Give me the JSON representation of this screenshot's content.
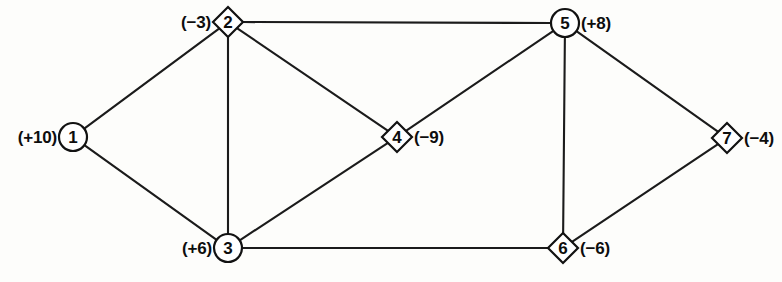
{
  "diagram": {
    "type": "network-flow-graph",
    "nodes": [
      {
        "id": "1",
        "label": "1",
        "shape": "circle",
        "x": 73,
        "y": 137,
        "supply": "(+10)",
        "supply_value": 10,
        "label_side": "left",
        "label_x": 57,
        "label_y": 137
      },
      {
        "id": "2",
        "label": "2",
        "shape": "diamond",
        "x": 228,
        "y": 22,
        "supply": "(−3)",
        "supply_value": -3,
        "label_side": "left",
        "label_x": 211,
        "label_y": 22
      },
      {
        "id": "3",
        "label": "3",
        "shape": "circle",
        "x": 228,
        "y": 248,
        "supply": "(+6)",
        "supply_value": 6,
        "label_side": "left",
        "label_x": 212,
        "label_y": 248
      },
      {
        "id": "4",
        "label": "4",
        "shape": "diamond",
        "x": 397,
        "y": 137,
        "supply": "(−9)",
        "supply_value": -9,
        "label_side": "right",
        "label_x": 414,
        "label_y": 137
      },
      {
        "id": "5",
        "label": "5",
        "shape": "circle",
        "x": 565,
        "y": 23,
        "supply": "(+8)",
        "supply_value": 8,
        "label_side": "right",
        "label_x": 581,
        "label_y": 23
      },
      {
        "id": "6",
        "label": "6",
        "shape": "diamond",
        "x": 563,
        "y": 248,
        "supply": "(−6)",
        "supply_value": -6,
        "label_side": "right",
        "label_x": 580,
        "label_y": 248
      },
      {
        "id": "7",
        "label": "7",
        "shape": "diamond",
        "x": 727,
        "y": 138,
        "supply": "(−4)",
        "supply_value": -4,
        "label_side": "right",
        "label_x": 744,
        "label_y": 138
      }
    ],
    "edges": [
      {
        "from": "1",
        "to": "2"
      },
      {
        "from": "1",
        "to": "3"
      },
      {
        "from": "2",
        "to": "3"
      },
      {
        "from": "2",
        "to": "4"
      },
      {
        "from": "2",
        "to": "5"
      },
      {
        "from": "3",
        "to": "4"
      },
      {
        "from": "3",
        "to": "6"
      },
      {
        "from": "4",
        "to": "5"
      },
      {
        "from": "5",
        "to": "6"
      },
      {
        "from": "5",
        "to": "7"
      },
      {
        "from": "6",
        "to": "7"
      }
    ],
    "style": {
      "circle_radius": 14,
      "diamond_half": 15,
      "line_color": "#1b1b1b",
      "node_fill": "#ffffff",
      "node_stroke": "#121212",
      "text_color": "#0d0d0d"
    }
  }
}
